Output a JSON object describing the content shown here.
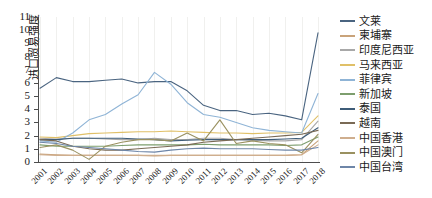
{
  "chart_data": {
    "type": "line",
    "title": "",
    "xlabel": "",
    "ylabel": "进口贸易强度",
    "ylim": [
      0,
      11
    ],
    "yticks": [
      0,
      1,
      2,
      3,
      4,
      5,
      6,
      7,
      8,
      9,
      10,
      11
    ],
    "grid": true,
    "legend_position": "right",
    "x": [
      "2001",
      "2002",
      "2003",
      "2004",
      "2005",
      "2006",
      "2007",
      "2008",
      "2009",
      "2010",
      "2011",
      "2012",
      "2013",
      "2014",
      "2015",
      "2016",
      "2017",
      "2018"
    ],
    "series": [
      {
        "name": "文莱",
        "color": "#4a6480",
        "values": [
          5.6,
          6.4,
          6.1,
          6.1,
          6.2,
          6.3,
          6.0,
          6.1,
          6.1,
          5.4,
          4.3,
          3.9,
          3.9,
          3.6,
          3.7,
          3.5,
          3.2,
          9.8
        ]
      },
      {
        "name": "柬埔寨",
        "color": "#c9a37a",
        "values": [
          0.6,
          0.55,
          0.5,
          0.5,
          0.5,
          0.5,
          0.5,
          0.45,
          0.5,
          0.5,
          0.5,
          0.5,
          0.5,
          0.5,
          0.5,
          0.5,
          0.55,
          1.6
        ]
      },
      {
        "name": "印度尼西亚",
        "color": "#a8a8a8",
        "values": [
          1.8,
          1.75,
          1.8,
          1.8,
          1.75,
          1.7,
          1.7,
          1.8,
          1.7,
          1.7,
          1.8,
          1.8,
          1.7,
          1.65,
          1.6,
          1.6,
          1.7,
          3.1
        ]
      },
      {
        "name": "马来西亚",
        "color": "#e0c068",
        "values": [
          1.9,
          1.85,
          2.0,
          2.15,
          2.2,
          2.25,
          2.3,
          2.3,
          2.35,
          2.3,
          2.25,
          2.2,
          2.2,
          2.15,
          2.2,
          2.2,
          2.25,
          3.5
        ]
      },
      {
        "name": "菲律宾",
        "color": "#8fb4d6",
        "values": [
          1.6,
          1.5,
          2.2,
          3.2,
          3.6,
          4.4,
          5.1,
          6.8,
          5.9,
          4.5,
          3.6,
          3.4,
          3.0,
          2.6,
          2.4,
          2.3,
          2.2,
          5.2
        ]
      },
      {
        "name": "新加坡",
        "color": "#7d9e6e",
        "values": [
          1.3,
          1.2,
          1.2,
          1.2,
          1.2,
          1.25,
          1.3,
          1.3,
          1.3,
          1.3,
          1.35,
          1.3,
          1.3,
          1.3,
          1.3,
          1.25,
          1.3,
          1.9
        ]
      },
      {
        "name": "泰国",
        "color": "#3e5c78",
        "values": [
          1.7,
          1.7,
          1.8,
          1.8,
          1.8,
          1.8,
          1.75,
          1.7,
          1.6,
          1.65,
          1.7,
          1.7,
          1.7,
          1.7,
          1.7,
          1.75,
          1.8,
          2.6
        ]
      },
      {
        "name": "越南",
        "color": "#7a6a55",
        "values": [
          1.7,
          1.6,
          1.2,
          1.0,
          0.9,
          0.9,
          1.0,
          1.1,
          1.2,
          1.3,
          1.5,
          1.6,
          1.7,
          1.8,
          1.9,
          2.0,
          2.1,
          2.4
        ]
      },
      {
        "name": "中国香港",
        "color": "#cfae8e",
        "values": [
          0.55,
          0.5,
          0.5,
          0.5,
          0.5,
          0.5,
          0.5,
          0.5,
          0.5,
          0.5,
          0.5,
          0.5,
          0.5,
          0.5,
          0.5,
          0.5,
          0.55,
          1.3
        ]
      },
      {
        "name": "中国澳门",
        "color": "#9a9160",
        "values": [
          1.1,
          1.3,
          0.9,
          0.2,
          1.2,
          1.5,
          1.7,
          1.7,
          1.6,
          2.2,
          1.6,
          3.2,
          1.4,
          1.6,
          1.4,
          1.3,
          0.7,
          2.1
        ]
      },
      {
        "name": "中国台湾",
        "color": "#6e86a8",
        "values": [
          1.5,
          1.4,
          1.2,
          1.1,
          1.0,
          0.9,
          0.8,
          0.75,
          0.9,
          1.0,
          1.05,
          1.0,
          1.0,
          1.0,
          0.95,
          0.9,
          0.9,
          1.1
        ]
      }
    ]
  },
  "legend": {
    "items": [
      {
        "label": "文莱"
      },
      {
        "label": "柬埔寨"
      },
      {
        "label": "印度尼西亚"
      },
      {
        "label": "马来西亚"
      },
      {
        "label": "菲律宾"
      },
      {
        "label": "新加坡"
      },
      {
        "label": "泰国"
      },
      {
        "label": "越南"
      },
      {
        "label": "中国香港"
      },
      {
        "label": "中国澳门"
      },
      {
        "label": "中国台湾"
      }
    ]
  }
}
